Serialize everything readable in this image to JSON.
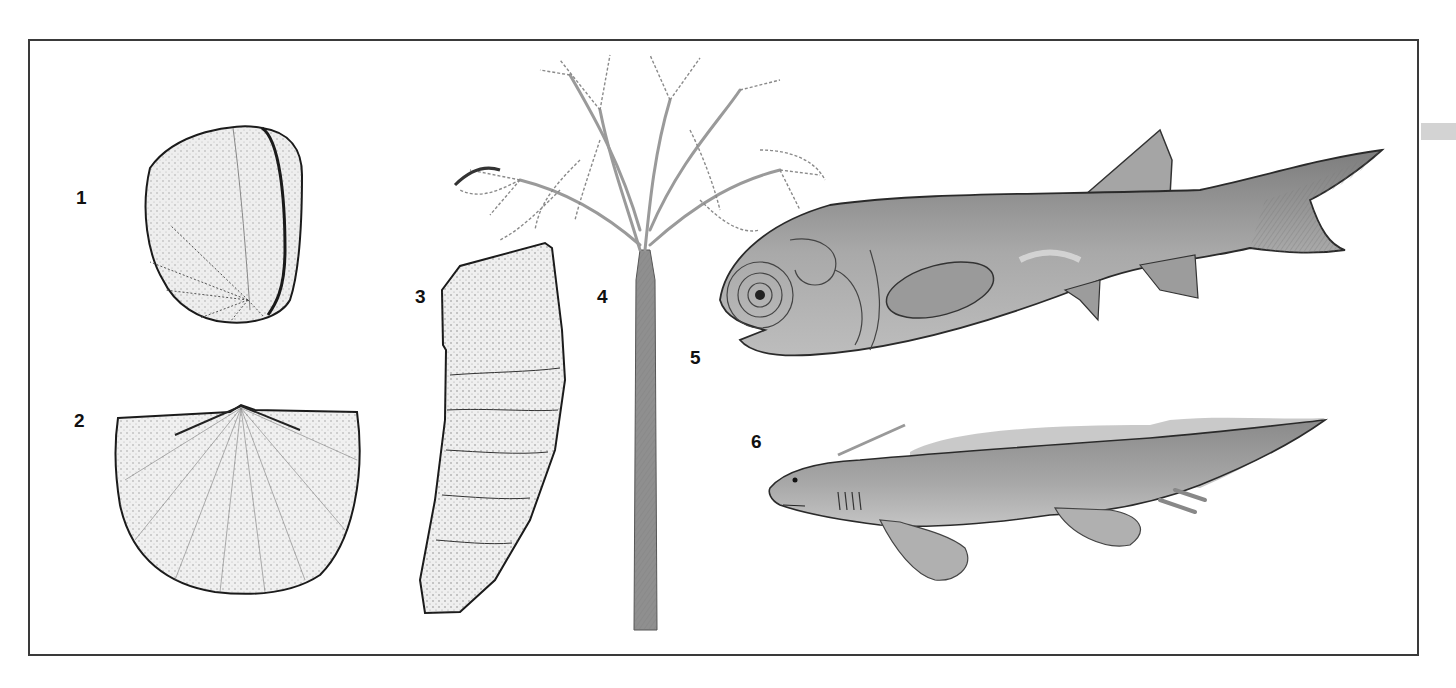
{
  "plate": {
    "description": "Illustration plate of fossil specimens and reconstructed organisms",
    "border_color": "#3a3a3a",
    "figures": [
      {
        "number": "1",
        "subject": "coiled shell (planispiral fossil)"
      },
      {
        "number": "2",
        "subject": "brachiopod shell"
      },
      {
        "number": "3",
        "subject": "horn coral"
      },
      {
        "number": "4",
        "subject": "early tree with feathery crown"
      },
      {
        "number": "5",
        "subject": "armored-head bony fish"
      },
      {
        "number": "6",
        "subject": "lobe-finned fish"
      }
    ]
  },
  "colors": {
    "ink": "#1a1a1a",
    "fish_body": "#9a9a9a",
    "fish_light": "#c8c8c8",
    "trunk": "#8a8a8a",
    "side_strip": "#d3d3d3"
  }
}
